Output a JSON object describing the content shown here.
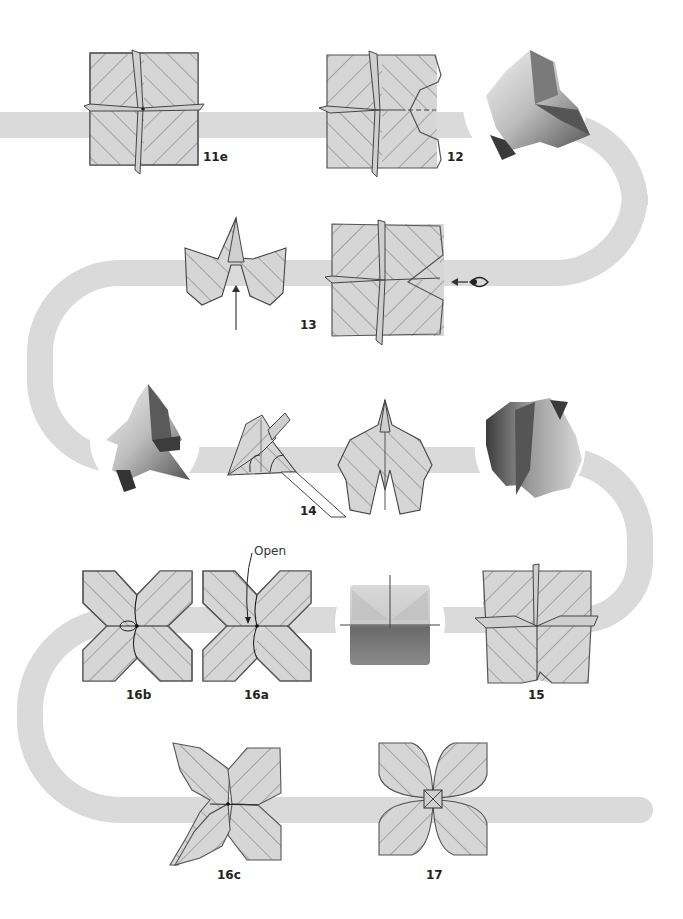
{
  "colors": {
    "band": "#dadada",
    "paper_fill": "#d6d6d6",
    "paper_stroke": "#555555",
    "hatch": "#777777",
    "label": "#222222",
    "photo_light": "#e8e8e8",
    "photo_mid": "#a8a8a8",
    "photo_dark": "#5a5a5a"
  },
  "steps": [
    {
      "id": "11e",
      "label": "11e"
    },
    {
      "id": "12",
      "label": "12"
    },
    {
      "id": "13",
      "label": "13"
    },
    {
      "id": "14",
      "label": "14"
    },
    {
      "id": "15",
      "label": "15"
    },
    {
      "id": "16a",
      "label": "16a"
    },
    {
      "id": "16b",
      "label": "16b"
    },
    {
      "id": "16c",
      "label": "16c"
    },
    {
      "id": "17",
      "label": "17"
    }
  ],
  "annotations": {
    "open": "Open"
  },
  "icons": {
    "eye": "eye-icon",
    "push_arrow": "arrow-up-icon",
    "view_arrow": "arrow-left-icon"
  }
}
